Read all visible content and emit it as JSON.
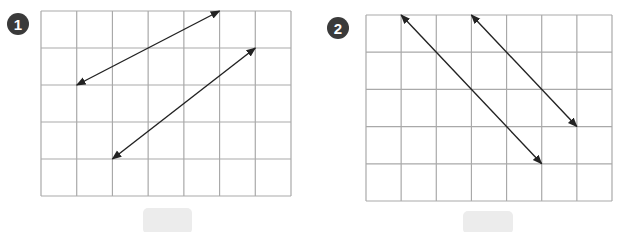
{
  "problems": [
    {
      "number": "1",
      "grid": {
        "cols": 7,
        "rows": 5,
        "x": 41,
        "y": 11,
        "width": 250,
        "height": 185
      },
      "arrows": [
        {
          "from": [
            5,
            0
          ],
          "to": [
            1,
            2
          ]
        },
        {
          "from": [
            6,
            1
          ],
          "to": [
            2,
            4
          ]
        }
      ],
      "answer_box": {
        "x": 143,
        "y": 208,
        "width": 49,
        "height": 26,
        "value": ""
      }
    },
    {
      "number": "2",
      "grid": {
        "cols": 7,
        "rows": 5,
        "x": 366,
        "y": 15,
        "width": 246,
        "height": 186
      },
      "arrows": [
        {
          "from": [
            1,
            0
          ],
          "to": [
            5,
            4
          ]
        },
        {
          "from": [
            3,
            0
          ],
          "to": [
            6,
            3
          ]
        }
      ],
      "answer_box": {
        "x": 463,
        "y": 211,
        "width": 50,
        "height": 23,
        "value": ""
      }
    }
  ],
  "colors": {
    "grid_line": "#a9a9a9",
    "arrow": "#222222",
    "badge": "#3a3a3a",
    "answer_box": "#ececec"
  }
}
